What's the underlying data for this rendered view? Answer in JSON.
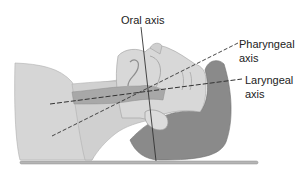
{
  "diagram": {
    "labels": {
      "oral_axis": "Oral axis",
      "pharyngeal_axis_line1": "Pharyngeal",
      "pharyngeal_axis_line2": "axis",
      "laryngeal_axis_line1": "Laryngeal",
      "laryngeal_axis_line2": "axis"
    },
    "colors": {
      "skin": "#d4d4d4",
      "airway": "#a9a9a9",
      "hair": "#7f7f7f",
      "outline": "#9a9a9a",
      "axis_line": "#333333",
      "table": "#b0b0b0"
    }
  }
}
